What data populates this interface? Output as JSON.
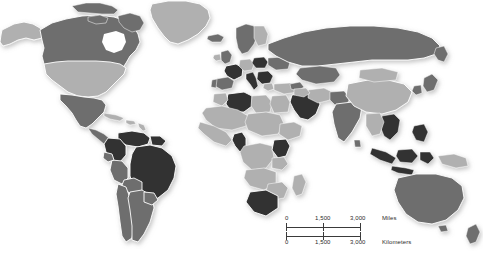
{
  "map": {
    "title": "World Map",
    "projection": "robinson-style world",
    "background_color": "#ffffff",
    "border_color": "#ffffff",
    "legend_tones": {
      "very_dark": "#303030",
      "dark_gray": "#6e6e6e",
      "light_gray": "#b0b0b0"
    },
    "shading_note": "grayscale choropleth, three fill tones, white country outlines, soft drop shadow beneath landmasses"
  },
  "scale_bar": {
    "miles": {
      "unit_label": "Miles",
      "ticks": [
        "0",
        "1,500",
        "3,000"
      ]
    },
    "kilometers": {
      "unit_label": "Kilometers",
      "ticks": [
        "0",
        "1,500",
        "3,000"
      ]
    }
  },
  "regions": [
    {
      "name": "Alaska",
      "tone": "light_gray"
    },
    {
      "name": "Canada",
      "tone": "dark_gray"
    },
    {
      "name": "United States",
      "tone": "light_gray"
    },
    {
      "name": "Mexico",
      "tone": "dark_gray"
    },
    {
      "name": "Central America",
      "tone": "dark_gray"
    },
    {
      "name": "Greenland",
      "tone": "light_gray"
    },
    {
      "name": "Cuba and Caribbean",
      "tone": "light_gray"
    },
    {
      "name": "Colombia",
      "tone": "very_dark"
    },
    {
      "name": "Venezuela",
      "tone": "very_dark"
    },
    {
      "name": "Brazil",
      "tone": "very_dark"
    },
    {
      "name": "Peru",
      "tone": "dark_gray"
    },
    {
      "name": "Bolivia",
      "tone": "dark_gray"
    },
    {
      "name": "Chile",
      "tone": "dark_gray"
    },
    {
      "name": "Argentina",
      "tone": "dark_gray"
    },
    {
      "name": "United Kingdom",
      "tone": "dark_gray"
    },
    {
      "name": "Ireland",
      "tone": "light_gray"
    },
    {
      "name": "France",
      "tone": "very_dark"
    },
    {
      "name": "Spain",
      "tone": "dark_gray"
    },
    {
      "name": "Portugal",
      "tone": "dark_gray"
    },
    {
      "name": "Germany",
      "tone": "light_gray"
    },
    {
      "name": "Italy",
      "tone": "very_dark"
    },
    {
      "name": "Poland",
      "tone": "very_dark"
    },
    {
      "name": "Scandinavia",
      "tone": "dark_gray"
    },
    {
      "name": "Eastern Europe",
      "tone": "very_dark"
    },
    {
      "name": "Turkey",
      "tone": "light_gray"
    },
    {
      "name": "Russia",
      "tone": "dark_gray"
    },
    {
      "name": "Kazakhstan",
      "tone": "dark_gray"
    },
    {
      "name": "China",
      "tone": "light_gray"
    },
    {
      "name": "Mongolia",
      "tone": "light_gray"
    },
    {
      "name": "Japan",
      "tone": "dark_gray"
    },
    {
      "name": "Korea",
      "tone": "dark_gray"
    },
    {
      "name": "India",
      "tone": "dark_gray"
    },
    {
      "name": "Vietnam",
      "tone": "very_dark"
    },
    {
      "name": "Indonesia",
      "tone": "very_dark"
    },
    {
      "name": "Philippines",
      "tone": "very_dark"
    },
    {
      "name": "Papua New Guinea",
      "tone": "light_gray"
    },
    {
      "name": "Australia",
      "tone": "dark_gray"
    },
    {
      "name": "New Zealand",
      "tone": "dark_gray"
    },
    {
      "name": "Algeria and Tunisia",
      "tone": "very_dark"
    },
    {
      "name": "Egypt",
      "tone": "light_gray"
    },
    {
      "name": "Saudi Arabia",
      "tone": "very_dark"
    },
    {
      "name": "North Africa",
      "tone": "light_gray"
    },
    {
      "name": "Cameroon",
      "tone": "very_dark"
    },
    {
      "name": "Kenya",
      "tone": "very_dark"
    },
    {
      "name": "Central Africa",
      "tone": "light_gray"
    },
    {
      "name": "Madagascar",
      "tone": "light_gray"
    },
    {
      "name": "South Africa",
      "tone": "very_dark"
    }
  ]
}
